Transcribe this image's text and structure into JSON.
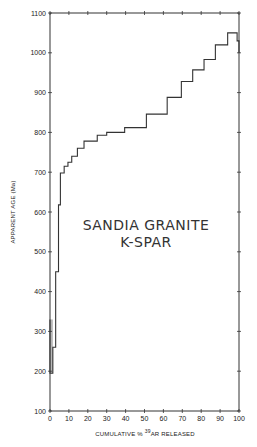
{
  "chart_data": {
    "type": "line",
    "subtype": "step (age spectrum)",
    "title": "",
    "annotation": [
      "SANDIA GRANITE",
      "K-SPAR"
    ],
    "xlabel_parts": {
      "pre": "CUMULATIVE % ",
      "sup": "39",
      "post": "AR RELEASED"
    },
    "xlabel": "CUMULATIVE % 39AR RELEASED",
    "ylabel": "APPARENT AGE (Ma)",
    "xlim": [
      0,
      100
    ],
    "ylim": [
      100,
      1100
    ],
    "xticks": [
      0,
      10,
      20,
      30,
      40,
      50,
      60,
      70,
      80,
      90,
      100
    ],
    "yticks": [
      100,
      200,
      300,
      400,
      500,
      600,
      700,
      800,
      900,
      1000,
      1100
    ],
    "grid": false,
    "legend": null,
    "steps": [
      {
        "x0": 0,
        "x1": 1.5,
        "age": 195
      },
      {
        "x0": 1.5,
        "x1": 3,
        "age": 260
      },
      {
        "x0": 3,
        "x1": 4.5,
        "age": 450
      },
      {
        "x0": 4.5,
        "x1": 5.5,
        "age": 618
      },
      {
        "x0": 5.5,
        "x1": 7.5,
        "age": 698
      },
      {
        "x0": 7.5,
        "x1": 9.5,
        "age": 715
      },
      {
        "x0": 9.5,
        "x1": 11.5,
        "age": 725
      },
      {
        "x0": 11.5,
        "x1": 14.5,
        "age": 740
      },
      {
        "x0": 14.5,
        "x1": 18,
        "age": 760
      },
      {
        "x0": 18,
        "x1": 25,
        "age": 778
      },
      {
        "x0": 25,
        "x1": 30,
        "age": 793
      },
      {
        "x0": 30,
        "x1": 39.5,
        "age": 800
      },
      {
        "x0": 39.5,
        "x1": 51,
        "age": 812
      },
      {
        "x0": 51,
        "x1": 62,
        "age": 846
      },
      {
        "x0": 62,
        "x1": 69.5,
        "age": 888
      },
      {
        "x0": 69.5,
        "x1": 75.5,
        "age": 928
      },
      {
        "x0": 75.5,
        "x1": 81.5,
        "age": 957
      },
      {
        "x0": 81.5,
        "x1": 87.5,
        "age": 983
      },
      {
        "x0": 87.5,
        "x1": 94,
        "age": 1020
      },
      {
        "x0": 94,
        "x1": 99,
        "age": 1050
      },
      {
        "x0": 99,
        "x1": 100,
        "age": 1030
      }
    ],
    "initial_spike": {
      "x": 0,
      "age": 330
    }
  }
}
